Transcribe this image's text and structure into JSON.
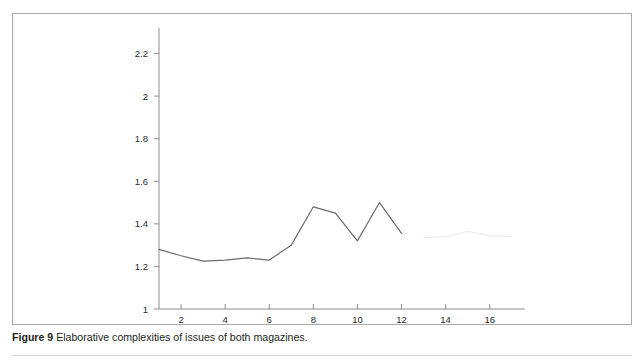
{
  "figure": {
    "caption_label": "Figure 9",
    "caption_body": " Elaborative complexities of issues of both magazines.",
    "frame_color": "#a9a9ab"
  },
  "chart_data": {
    "type": "line",
    "title": "",
    "xlabel": "",
    "ylabel": "",
    "xlim": [
      1,
      17.6
    ],
    "ylim": [
      1,
      2.32
    ],
    "grid": false,
    "legend": "none",
    "x_ticks": [
      2,
      4,
      6,
      8,
      10,
      12,
      14,
      16
    ],
    "x_tick_labels": [
      "2",
      "4",
      "6",
      "8",
      "10",
      "12",
      "14",
      "16"
    ],
    "y_ticks": [
      1,
      1.2,
      1.4,
      1.6,
      1.8,
      2,
      2.2
    ],
    "y_tick_labels": [
      "1",
      "1.2",
      "1.4",
      "1.6",
      "1.8",
      "2",
      "2.2"
    ],
    "series": [
      {
        "name": "magazine-series-primary",
        "color": "#6b6b6d",
        "opacity": 1,
        "x": [
          1,
          2,
          3,
          4,
          5,
          6,
          7,
          8,
          9,
          10,
          11,
          12
        ],
        "values": [
          1.28,
          1.25,
          1.225,
          1.23,
          1.24,
          1.23,
          1.3,
          1.48,
          1.45,
          1.32,
          1.5,
          1.355
        ]
      },
      {
        "name": "magazine-series-faint",
        "color": "#ededee",
        "opacity": 1,
        "x": [
          13,
          14,
          15,
          16,
          17
        ],
        "values": [
          1.335,
          1.34,
          1.365,
          1.345,
          1.34
        ]
      }
    ]
  }
}
